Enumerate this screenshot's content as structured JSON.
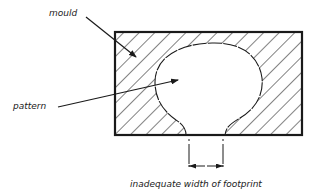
{
  "diagram": {
    "labels": {
      "mould": "mould",
      "pattern": "pattern",
      "caption": "inadequate width of footprint"
    },
    "colors": {
      "ink": "#1a1a1a",
      "background": "#ffffff"
    },
    "elements": {
      "mould_box": "rectangle with diagonal hatching",
      "pattern_shape": "rounded cavity opening at the bottom with narrow footprint",
      "dimension": "footprint width dimension with arrows"
    }
  }
}
